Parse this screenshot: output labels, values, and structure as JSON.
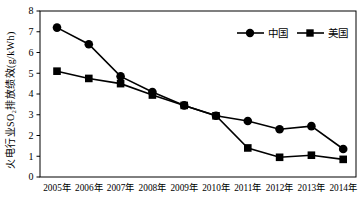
{
  "chart_data": {
    "type": "line",
    "title": "",
    "categories": [
      "2005年",
      "2006年",
      "2007年",
      "2008年",
      "2009年",
      "2010年",
      "2011年",
      "2012年",
      "2013年",
      "2014年"
    ],
    "series": [
      {
        "name": "中国",
        "marker": "circle",
        "color": "#000000",
        "values": [
          7.2,
          6.4,
          4.85,
          4.1,
          3.45,
          2.95,
          2.7,
          2.3,
          2.45,
          1.35
        ]
      },
      {
        "name": "美国",
        "marker": "square",
        "color": "#000000",
        "values": [
          5.1,
          4.75,
          4.5,
          3.95,
          3.45,
          2.95,
          1.4,
          0.95,
          1.05,
          0.85
        ]
      }
    ],
    "xlabel": "",
    "ylabel": "火电行业SO₂排放绩效(g/kWh)",
    "ylim": [
      0,
      8
    ],
    "yticks": [
      0,
      1,
      2,
      3,
      4,
      5,
      6,
      7,
      8
    ],
    "grid": false,
    "legend_position": "top-right-inside",
    "background": "#ffffff",
    "foreground": "#000000"
  }
}
